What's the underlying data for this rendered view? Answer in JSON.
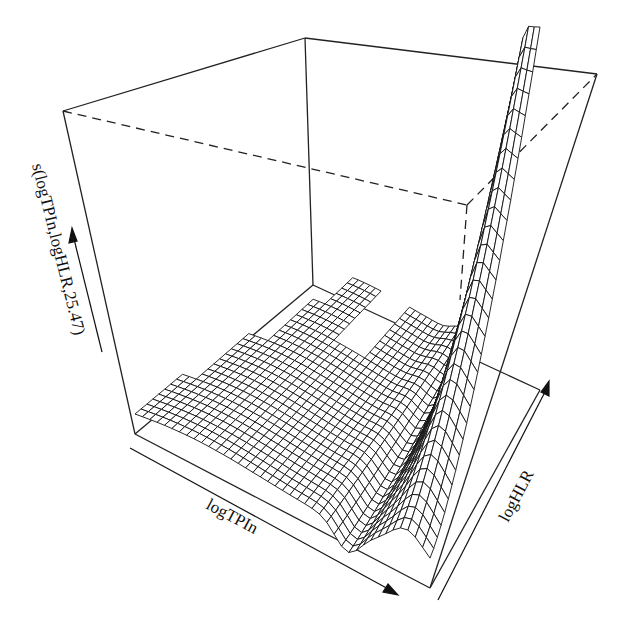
{
  "chart_data": {
    "type": "surface3d",
    "title": "",
    "xlabel": "logTPIn",
    "ylabel": "logHLR",
    "zlabel": "s(logTPIn,logHLR,25.47)",
    "grid": false,
    "legend": null,
    "render_style": "wireframe perspective mesh (persp), no tick labels",
    "surface_features": [
      {
        "region": "low logTPIn, low-mid logHLR",
        "level": "low, flat"
      },
      {
        "region": "mid logTPIn",
        "level": "gentle undulation"
      },
      {
        "region": "high logTPIn, low logHLR",
        "level": "sharp trough then ridge"
      },
      {
        "region": "high logTPIn, high logHLR",
        "level": "maximum, steep rise"
      }
    ]
  },
  "axes": {
    "x": {
      "label": "logTPIn",
      "arrow": "toward front-right"
    },
    "y": {
      "label": "logHLR",
      "arrow": "toward back-right"
    },
    "z": {
      "label": "s(logTPIn,logHLR,25.47)",
      "arrow": "upward"
    }
  },
  "colors": {
    "mesh": "#111111",
    "box": "#222222",
    "background": "#ffffff"
  }
}
